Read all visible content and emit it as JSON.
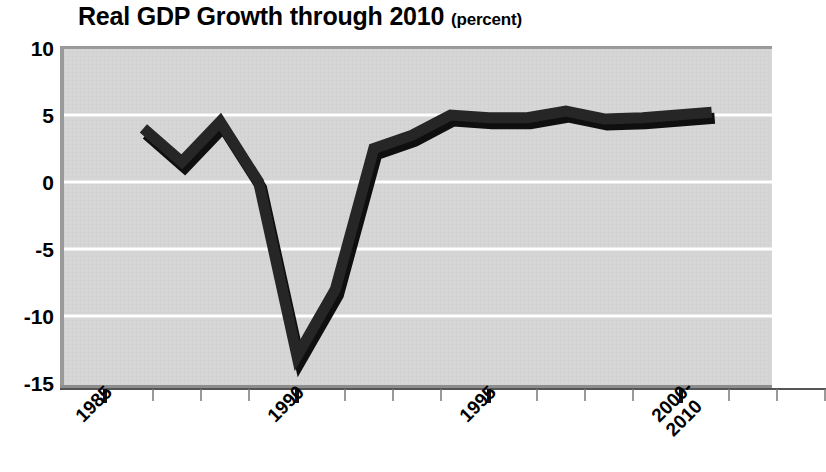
{
  "chart_data": {
    "type": "line",
    "title": "Real GDP Growth through 2010",
    "title_unit": "(percent)",
    "xlabel": "",
    "ylabel": "",
    "ylim": [
      -15,
      10
    ],
    "yticks": [
      10,
      5,
      0,
      -5,
      -10,
      -15
    ],
    "ytick_labels": [
      "10",
      "5",
      "0",
      "-5",
      "-10",
      "-15"
    ],
    "xtick_labels": [
      "1985",
      "1990",
      "1995",
      "2000-\n2010"
    ],
    "xtick_major_values": [
      1985,
      1990,
      1995,
      2000
    ],
    "xlim": [
      1985,
      2001
    ],
    "grid": "horizontal",
    "legend": "none",
    "line_color": "#1a1a1a",
    "plot_background": "#d4d4d4",
    "gridline_color": "#ffffff",
    "x": [
      1986,
      1987,
      1988,
      1989,
      1990,
      1991,
      1992,
      1993,
      1994,
      1995,
      1996,
      1997,
      1998,
      1999,
      2000.8
    ],
    "values": [
      4.0,
      1.5,
      4.5,
      0.0,
      -13.0,
      -8.0,
      2.5,
      3.5,
      5.0,
      4.8,
      4.8,
      5.3,
      4.7,
      4.8,
      5.2
    ],
    "series": [
      {
        "name": "Real GDP growth",
        "values": [
          4.0,
          1.5,
          4.5,
          0.0,
          -13.0,
          -8.0,
          2.5,
          3.5,
          5.0,
          4.8,
          4.8,
          5.3,
          4.7,
          4.8,
          5.2
        ]
      }
    ]
  },
  "axis": {
    "x_labels": [
      {
        "text": "1985",
        "x": 105
      },
      {
        "text": "1990",
        "x": 297
      },
      {
        "text": "1995",
        "x": 489
      },
      {
        "text": "2000-",
        "x": 681,
        "second_line": "2010"
      }
    ]
  }
}
